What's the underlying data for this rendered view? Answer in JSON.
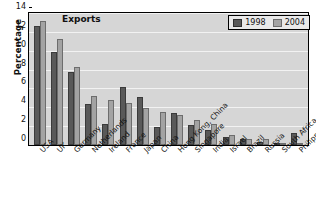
{
  "chart_data": {
    "type": "bar",
    "title": "Exports",
    "xlabel": "",
    "ylabel": "Percentage",
    "ylim": [
      0,
      14
    ],
    "yticks": [
      0,
      2,
      4,
      6,
      8,
      10,
      12,
      14
    ],
    "grid": true,
    "legend_position": "top-right",
    "categories": [
      "USA",
      "UK",
      "Germany",
      "Netherlands",
      "Ireland",
      "France",
      "Japan",
      "China",
      "Hong Kong, China",
      "Singapore",
      "India",
      "Israel",
      "Brazil",
      "Russia",
      "South Africa",
      "Philippines"
    ],
    "series": [
      {
        "name": "1998",
        "color": "#595959",
        "values": [
          12.6,
          9.9,
          7.7,
          4.3,
          2.2,
          6.2,
          5.1,
          1.9,
          3.4,
          2.1,
          1.6,
          0.8,
          0.6,
          0.3,
          0.1,
          1.3
        ]
      },
      {
        "name": "2004",
        "color": "#a3a3a3",
        "values": [
          13.2,
          11.2,
          8.3,
          5.2,
          4.8,
          4.5,
          3.9,
          3.5,
          3.2,
          2.7,
          2.2,
          1.1,
          0.6,
          0.6,
          0.1,
          0.05
        ]
      }
    ]
  },
  "legend": {
    "items": [
      {
        "label": "1998"
      },
      {
        "label": "2004"
      }
    ]
  }
}
